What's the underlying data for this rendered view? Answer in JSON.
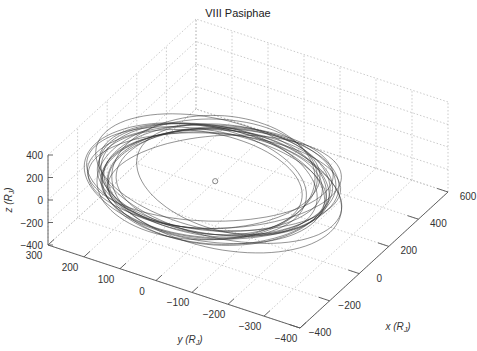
{
  "chart_data": {
    "type": "line3d",
    "title": "VIII Pasiphae",
    "xlabel": "x (R_J)",
    "ylabel": "y (R_J)",
    "zlabel": "z (R_J)",
    "xlim": [
      -400,
      600
    ],
    "ylim": [
      -400,
      300
    ],
    "zlim": [
      -400,
      400
    ],
    "xticks": [
      -400,
      -200,
      0,
      200,
      400,
      600
    ],
    "yticks": [
      300,
      200,
      100,
      0,
      -100,
      -200,
      -300,
      -400
    ],
    "zticks": [
      400,
      200,
      0,
      -200,
      -400
    ],
    "grid": true,
    "grid_style": "dotted",
    "series": [
      {
        "name": "Pasiphae orbit trajectory",
        "description": "Many overlapping, precessing elliptical loops around Jupiter, roughly in the x-y plane with small z excursions",
        "approx_extent": {
          "x": [
            -380,
            380
          ],
          "y": [
            -330,
            330
          ],
          "z": [
            -100,
            100
          ]
        },
        "num_loops": 20,
        "color": "#333333"
      },
      {
        "name": "Jupiter",
        "marker": "circle",
        "position": [
          0,
          0,
          0
        ],
        "color": "#888888"
      }
    ]
  },
  "labels": {
    "title": "VIII Pasiphae",
    "x_axis": "x (R",
    "y_axis": "y (R",
    "z_axis": "z (R",
    "sub": "J",
    "close": ")"
  }
}
